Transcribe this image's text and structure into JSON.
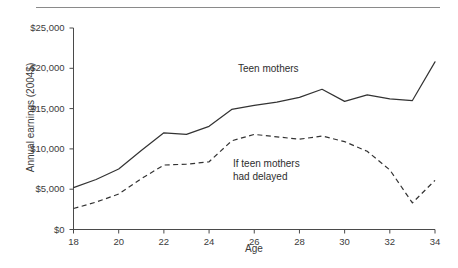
{
  "chart_data": {
    "type": "line",
    "title": "",
    "xlabel": "Age",
    "ylabel": "Annual earnings (2004$)",
    "xlim": [
      18,
      34
    ],
    "ylim": [
      0,
      25000
    ],
    "grid": false,
    "legend_position": "inline-annotations",
    "x_ticks": [
      "18",
      "20",
      "22",
      "24",
      "26",
      "28",
      "30",
      "32",
      "34"
    ],
    "x_tick_values": [
      18,
      20,
      22,
      24,
      26,
      28,
      30,
      32,
      34
    ],
    "y_ticks": [
      "$0",
      "$5,000",
      "$10,000",
      "$15,000",
      "$20,000",
      "$25,000"
    ],
    "y_tick_values": [
      0,
      5000,
      10000,
      15000,
      20000,
      25000
    ],
    "x": [
      18,
      19,
      20,
      21,
      22,
      23,
      24,
      25,
      26,
      27,
      28,
      29,
      30,
      31,
      32,
      33,
      34
    ],
    "series": [
      {
        "name": "Teen mothers",
        "style": "solid",
        "color": "#333333",
        "values": [
          5200,
          6200,
          7500,
          9800,
          12000,
          11800,
          12800,
          14900,
          15400,
          15800,
          16400,
          17400,
          15900,
          16700,
          16200,
          16000,
          20800
        ]
      },
      {
        "name": "If teen mothers had delayed",
        "style": "dashed",
        "color": "#333333",
        "values": [
          2600,
          3400,
          4400,
          6300,
          8000,
          8100,
          8400,
          11000,
          11800,
          11500,
          11200,
          11600,
          10900,
          9700,
          7400,
          3300,
          6100
        ]
      }
    ],
    "annotations": [
      {
        "text": "Teen mothers",
        "series": "Teen mothers"
      },
      {
        "text_line_1": "If teen mothers",
        "text_line_2": "had delayed",
        "series": "If teen mothers had delayed"
      }
    ]
  },
  "axes": {
    "y_title": "Annual earnings (2004$)",
    "x_title": "Age",
    "y_tick_labels": [
      "$25,000",
      "$20,000",
      "$15,000",
      "$10,000",
      "$5,000",
      "$0"
    ],
    "x_tick_labels": [
      "18",
      "20",
      "22",
      "24",
      "26",
      "28",
      "30",
      "32",
      "34"
    ]
  },
  "annotations": {
    "teen_mothers": "Teen mothers",
    "if_delayed_line1": "If teen mothers",
    "if_delayed_line2": "had delayed"
  },
  "colors": {
    "axis": "#4a4a4a",
    "line": "#333333",
    "rule": "#8a8a8a",
    "text": "#3b3b3b",
    "background": "#ffffff"
  }
}
